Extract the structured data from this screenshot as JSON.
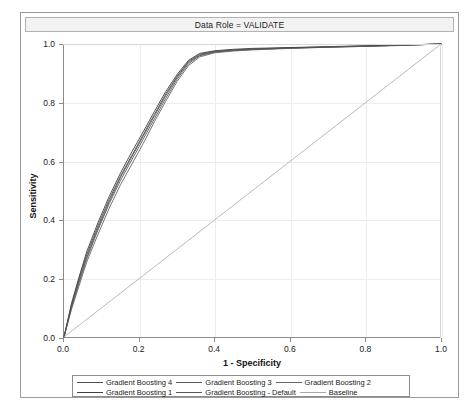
{
  "panel": {
    "title": "Data Role = VALIDATE"
  },
  "chart_data": {
    "type": "line",
    "title": "Data Role = VALIDATE",
    "xlabel": "1 - Specificity",
    "ylabel": "Sensitivity",
    "xlim": [
      0.0,
      1.0
    ],
    "ylim": [
      0.0,
      1.0
    ],
    "xticks": [
      "0.0",
      "0.2",
      "0.4",
      "0.6",
      "0.8",
      "1.0"
    ],
    "yticks": [
      "0.0",
      "0.2",
      "0.4",
      "0.6",
      "0.8",
      "1.0"
    ],
    "xtick_values": [
      0.0,
      0.2,
      0.4,
      0.6,
      0.8,
      1.0
    ],
    "ytick_values": [
      0.0,
      0.2,
      0.4,
      0.6,
      0.8,
      1.0
    ],
    "grid": true,
    "legend_position": "bottom",
    "series": [
      {
        "name": "Gradient Boosting 4",
        "color": "#4d4d4d",
        "x": [
          0.0,
          0.02,
          0.04,
          0.06,
          0.09,
          0.12,
          0.15,
          0.18,
          0.21,
          0.24,
          0.27,
          0.3,
          0.33,
          0.36,
          0.4,
          0.45,
          0.5,
          0.6,
          0.7,
          0.8,
          0.9,
          1.0
        ],
        "y": [
          0.0,
          0.11,
          0.2,
          0.28,
          0.38,
          0.47,
          0.55,
          0.62,
          0.69,
          0.76,
          0.83,
          0.89,
          0.94,
          0.965,
          0.975,
          0.98,
          0.983,
          0.987,
          0.99,
          0.993,
          0.996,
          1.0
        ]
      },
      {
        "name": "Gradient Boosting 3",
        "color": "#5a5a5a",
        "x": [
          0.0,
          0.02,
          0.04,
          0.06,
          0.09,
          0.12,
          0.15,
          0.18,
          0.21,
          0.24,
          0.27,
          0.3,
          0.33,
          0.36,
          0.4,
          0.45,
          0.5,
          0.6,
          0.7,
          0.8,
          0.9,
          1.0
        ],
        "y": [
          0.0,
          0.1,
          0.185,
          0.265,
          0.365,
          0.455,
          0.535,
          0.605,
          0.675,
          0.745,
          0.815,
          0.88,
          0.932,
          0.96,
          0.972,
          0.978,
          0.981,
          0.986,
          0.989,
          0.992,
          0.996,
          1.0
        ]
      },
      {
        "name": "Gradient Boosting 2",
        "color": "#666666",
        "x": [
          0.0,
          0.02,
          0.04,
          0.06,
          0.09,
          0.12,
          0.15,
          0.18,
          0.21,
          0.24,
          0.27,
          0.3,
          0.33,
          0.36,
          0.4,
          0.45,
          0.5,
          0.6,
          0.7,
          0.8,
          0.9,
          1.0
        ],
        "y": [
          0.0,
          0.095,
          0.175,
          0.255,
          0.35,
          0.44,
          0.52,
          0.59,
          0.66,
          0.735,
          0.805,
          0.872,
          0.926,
          0.956,
          0.97,
          0.976,
          0.98,
          0.985,
          0.989,
          0.992,
          0.995,
          1.0
        ]
      },
      {
        "name": "Gradient Boosting 1",
        "color": "#3f3f3f",
        "x": [
          0.0,
          0.02,
          0.04,
          0.06,
          0.09,
          0.12,
          0.15,
          0.18,
          0.21,
          0.24,
          0.27,
          0.3,
          0.33,
          0.36,
          0.4,
          0.45,
          0.5,
          0.6,
          0.7,
          0.8,
          0.9,
          1.0
        ],
        "y": [
          0.0,
          0.115,
          0.205,
          0.29,
          0.39,
          0.48,
          0.56,
          0.632,
          0.7,
          0.77,
          0.838,
          0.896,
          0.944,
          0.968,
          0.977,
          0.982,
          0.985,
          0.988,
          0.991,
          0.994,
          0.997,
          1.0
        ]
      },
      {
        "name": "Gradient Boosting - Default",
        "color": "#555555",
        "x": [
          0.0,
          0.02,
          0.04,
          0.06,
          0.09,
          0.12,
          0.15,
          0.18,
          0.21,
          0.24,
          0.27,
          0.3,
          0.33,
          0.36,
          0.4,
          0.45,
          0.5,
          0.6,
          0.7,
          0.8,
          0.9,
          1.0
        ],
        "y": [
          0.0,
          0.105,
          0.192,
          0.272,
          0.372,
          0.462,
          0.545,
          0.615,
          0.685,
          0.755,
          0.824,
          0.886,
          0.937,
          0.962,
          0.974,
          0.979,
          0.982,
          0.986,
          0.99,
          0.993,
          0.996,
          1.0
        ]
      },
      {
        "name": "Baseline",
        "color": "#a8a8a8",
        "x": [
          0.0,
          1.0
        ],
        "y": [
          0.0,
          1.0
        ]
      }
    ]
  },
  "legend": {
    "rows": [
      [
        {
          "label": "Gradient Boosting 4",
          "color": "#4d4d4d"
        },
        {
          "label": "Gradient Boosting 3",
          "color": "#5a5a5a"
        },
        {
          "label": "Gradient Boosting 2",
          "color": "#666666"
        }
      ],
      [
        {
          "label": "Gradient Boosting 1",
          "color": "#3f3f3f"
        },
        {
          "label": "Gradient Boosting - Default",
          "color": "#555555"
        },
        {
          "label": "Baseline",
          "color": "#a8a8a8"
        }
      ]
    ]
  }
}
